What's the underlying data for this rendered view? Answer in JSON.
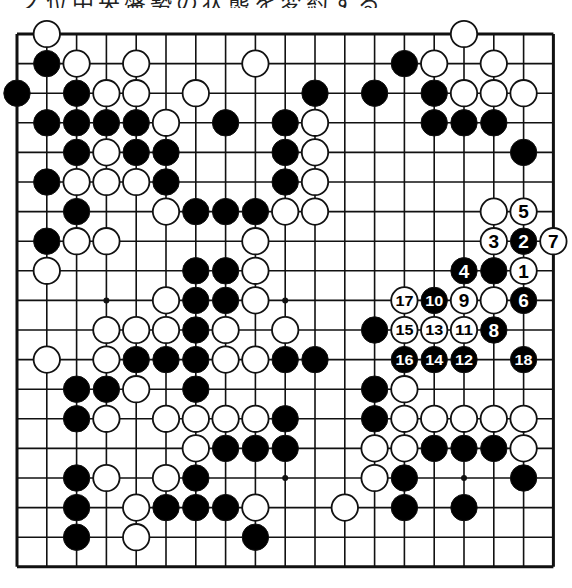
{
  "caption": "ノ位中央盤勢の状態を変約する",
  "board": {
    "size": 19,
    "origin": {
      "x": 17,
      "y": 34
    },
    "spacing": {
      "x": 29.8,
      "y": 29.6
    },
    "line_color": "#111111",
    "black_color": "#000000",
    "white_color": "#ffffff",
    "star_points": [
      [
        3,
        3
      ],
      [
        3,
        9
      ],
      [
        3,
        15
      ],
      [
        9,
        3
      ],
      [
        9,
        9
      ],
      [
        9,
        15
      ],
      [
        15,
        3
      ],
      [
        15,
        9
      ],
      [
        15,
        15
      ]
    ],
    "visible_star_points": [
      [
        9,
        9
      ],
      [
        15,
        9
      ],
      [
        15,
        15
      ]
    ]
  },
  "stones": [
    {
      "row": 0,
      "col": 1,
      "color": "white"
    },
    {
      "row": 0,
      "col": 15,
      "color": "white"
    },
    {
      "row": 1,
      "col": 1,
      "color": "black"
    },
    {
      "row": 1,
      "col": 2,
      "color": "white"
    },
    {
      "row": 1,
      "col": 4,
      "color": "white"
    },
    {
      "row": 1,
      "col": 8,
      "color": "white"
    },
    {
      "row": 1,
      "col": 13,
      "color": "black"
    },
    {
      "row": 1,
      "col": 14,
      "color": "white"
    },
    {
      "row": 1,
      "col": 16,
      "color": "white"
    },
    {
      "row": 2,
      "col": 0,
      "color": "black"
    },
    {
      "row": 2,
      "col": 2,
      "color": "black"
    },
    {
      "row": 2,
      "col": 3,
      "color": "white"
    },
    {
      "row": 2,
      "col": 4,
      "color": "white"
    },
    {
      "row": 2,
      "col": 6,
      "color": "white"
    },
    {
      "row": 2,
      "col": 10,
      "color": "black"
    },
    {
      "row": 2,
      "col": 12,
      "color": "black"
    },
    {
      "row": 2,
      "col": 14,
      "color": "black"
    },
    {
      "row": 2,
      "col": 15,
      "color": "white"
    },
    {
      "row": 2,
      "col": 16,
      "color": "white"
    },
    {
      "row": 2,
      "col": 17,
      "color": "white"
    },
    {
      "row": 3,
      "col": 1,
      "color": "black"
    },
    {
      "row": 3,
      "col": 2,
      "color": "black"
    },
    {
      "row": 3,
      "col": 3,
      "color": "black"
    },
    {
      "row": 3,
      "col": 4,
      "color": "black"
    },
    {
      "row": 3,
      "col": 5,
      "color": "white"
    },
    {
      "row": 3,
      "col": 7,
      "color": "black"
    },
    {
      "row": 3,
      "col": 9,
      "color": "black"
    },
    {
      "row": 3,
      "col": 10,
      "color": "white"
    },
    {
      "row": 3,
      "col": 14,
      "color": "black"
    },
    {
      "row": 3,
      "col": 15,
      "color": "black"
    },
    {
      "row": 3,
      "col": 16,
      "color": "black"
    },
    {
      "row": 4,
      "col": 2,
      "color": "black"
    },
    {
      "row": 4,
      "col": 3,
      "color": "white"
    },
    {
      "row": 4,
      "col": 4,
      "color": "black"
    },
    {
      "row": 4,
      "col": 5,
      "color": "black"
    },
    {
      "row": 4,
      "col": 9,
      "color": "black"
    },
    {
      "row": 4,
      "col": 10,
      "color": "white"
    },
    {
      "row": 4,
      "col": 17,
      "color": "black"
    },
    {
      "row": 5,
      "col": 1,
      "color": "black"
    },
    {
      "row": 5,
      "col": 2,
      "color": "white"
    },
    {
      "row": 5,
      "col": 3,
      "color": "white"
    },
    {
      "row": 5,
      "col": 4,
      "color": "white"
    },
    {
      "row": 5,
      "col": 5,
      "color": "black"
    },
    {
      "row": 5,
      "col": 9,
      "color": "black"
    },
    {
      "row": 5,
      "col": 10,
      "color": "white"
    },
    {
      "row": 6,
      "col": 2,
      "color": "black"
    },
    {
      "row": 6,
      "col": 5,
      "color": "white"
    },
    {
      "row": 6,
      "col": 6,
      "color": "black"
    },
    {
      "row": 6,
      "col": 7,
      "color": "black"
    },
    {
      "row": 6,
      "col": 8,
      "color": "black"
    },
    {
      "row": 6,
      "col": 9,
      "color": "white"
    },
    {
      "row": 6,
      "col": 10,
      "color": "white"
    },
    {
      "row": 6,
      "col": 16,
      "color": "white"
    },
    {
      "row": 6,
      "col": 17,
      "color": "white",
      "label": "5"
    },
    {
      "row": 7,
      "col": 1,
      "color": "black"
    },
    {
      "row": 7,
      "col": 2,
      "color": "white"
    },
    {
      "row": 7,
      "col": 3,
      "color": "white"
    },
    {
      "row": 7,
      "col": 8,
      "color": "white"
    },
    {
      "row": 7,
      "col": 16,
      "color": "white",
      "label": "3"
    },
    {
      "row": 7,
      "col": 17,
      "color": "black",
      "label": "2"
    },
    {
      "row": 7,
      "col": 18,
      "color": "white",
      "label": "7"
    },
    {
      "row": 8,
      "col": 1,
      "color": "white"
    },
    {
      "row": 8,
      "col": 6,
      "color": "black"
    },
    {
      "row": 8,
      "col": 7,
      "color": "black"
    },
    {
      "row": 8,
      "col": 8,
      "color": "white"
    },
    {
      "row": 8,
      "col": 15,
      "color": "black",
      "label": "4"
    },
    {
      "row": 8,
      "col": 16,
      "color": "black"
    },
    {
      "row": 8,
      "col": 17,
      "color": "white",
      "label": "1"
    },
    {
      "row": 9,
      "col": 5,
      "color": "white"
    },
    {
      "row": 9,
      "col": 6,
      "color": "black"
    },
    {
      "row": 9,
      "col": 7,
      "color": "black"
    },
    {
      "row": 9,
      "col": 8,
      "color": "white"
    },
    {
      "row": 9,
      "col": 13,
      "color": "white",
      "label": "17"
    },
    {
      "row": 9,
      "col": 14,
      "color": "black",
      "label": "10"
    },
    {
      "row": 9,
      "col": 15,
      "color": "white",
      "label": "9"
    },
    {
      "row": 9,
      "col": 16,
      "color": "white"
    },
    {
      "row": 9,
      "col": 17,
      "color": "black",
      "label": "6"
    },
    {
      "row": 10,
      "col": 3,
      "color": "white"
    },
    {
      "row": 10,
      "col": 4,
      "color": "white"
    },
    {
      "row": 10,
      "col": 5,
      "color": "white"
    },
    {
      "row": 10,
      "col": 6,
      "color": "black"
    },
    {
      "row": 10,
      "col": 7,
      "color": "white"
    },
    {
      "row": 10,
      "col": 9,
      "color": "white"
    },
    {
      "row": 10,
      "col": 12,
      "color": "black"
    },
    {
      "row": 10,
      "col": 13,
      "color": "white",
      "label": "15"
    },
    {
      "row": 10,
      "col": 14,
      "color": "white",
      "label": "13"
    },
    {
      "row": 10,
      "col": 15,
      "color": "white",
      "label": "11"
    },
    {
      "row": 10,
      "col": 16,
      "color": "black",
      "label": "8"
    },
    {
      "row": 11,
      "col": 1,
      "color": "white"
    },
    {
      "row": 11,
      "col": 3,
      "color": "white"
    },
    {
      "row": 11,
      "col": 4,
      "color": "black"
    },
    {
      "row": 11,
      "col": 5,
      "color": "black"
    },
    {
      "row": 11,
      "col": 6,
      "color": "black"
    },
    {
      "row": 11,
      "col": 7,
      "color": "white"
    },
    {
      "row": 11,
      "col": 8,
      "color": "white"
    },
    {
      "row": 11,
      "col": 9,
      "color": "black"
    },
    {
      "row": 11,
      "col": 10,
      "color": "black"
    },
    {
      "row": 11,
      "col": 13,
      "color": "black",
      "label": "16"
    },
    {
      "row": 11,
      "col": 14,
      "color": "black",
      "label": "14"
    },
    {
      "row": 11,
      "col": 15,
      "color": "black",
      "label": "12"
    },
    {
      "row": 11,
      "col": 17,
      "color": "black",
      "label": "18"
    },
    {
      "row": 12,
      "col": 2,
      "color": "black"
    },
    {
      "row": 12,
      "col": 3,
      "color": "black"
    },
    {
      "row": 12,
      "col": 4,
      "color": "white"
    },
    {
      "row": 12,
      "col": 6,
      "color": "black"
    },
    {
      "row": 12,
      "col": 12,
      "color": "black"
    },
    {
      "row": 12,
      "col": 13,
      "color": "white"
    },
    {
      "row": 13,
      "col": 2,
      "color": "black"
    },
    {
      "row": 13,
      "col": 3,
      "color": "white"
    },
    {
      "row": 13,
      "col": 5,
      "color": "white"
    },
    {
      "row": 13,
      "col": 6,
      "color": "white"
    },
    {
      "row": 13,
      "col": 7,
      "color": "white"
    },
    {
      "row": 13,
      "col": 8,
      "color": "white"
    },
    {
      "row": 13,
      "col": 9,
      "color": "black"
    },
    {
      "row": 13,
      "col": 12,
      "color": "black"
    },
    {
      "row": 13,
      "col": 13,
      "color": "white"
    },
    {
      "row": 13,
      "col": 14,
      "color": "white"
    },
    {
      "row": 13,
      "col": 15,
      "color": "white"
    },
    {
      "row": 13,
      "col": 16,
      "color": "white"
    },
    {
      "row": 13,
      "col": 17,
      "color": "white"
    },
    {
      "row": 14,
      "col": 6,
      "color": "white"
    },
    {
      "row": 14,
      "col": 7,
      "color": "black"
    },
    {
      "row": 14,
      "col": 8,
      "color": "black"
    },
    {
      "row": 14,
      "col": 9,
      "color": "black"
    },
    {
      "row": 14,
      "col": 12,
      "color": "white"
    },
    {
      "row": 14,
      "col": 13,
      "color": "white"
    },
    {
      "row": 14,
      "col": 14,
      "color": "black"
    },
    {
      "row": 14,
      "col": 15,
      "color": "black"
    },
    {
      "row": 14,
      "col": 16,
      "color": "black"
    },
    {
      "row": 14,
      "col": 17,
      "color": "white"
    },
    {
      "row": 15,
      "col": 2,
      "color": "black"
    },
    {
      "row": 15,
      "col": 3,
      "color": "white"
    },
    {
      "row": 15,
      "col": 5,
      "color": "white"
    },
    {
      "row": 15,
      "col": 6,
      "color": "black"
    },
    {
      "row": 15,
      "col": 12,
      "color": "white"
    },
    {
      "row": 15,
      "col": 13,
      "color": "black"
    },
    {
      "row": 15,
      "col": 17,
      "color": "black"
    },
    {
      "row": 16,
      "col": 2,
      "color": "black"
    },
    {
      "row": 16,
      "col": 4,
      "color": "white"
    },
    {
      "row": 16,
      "col": 5,
      "color": "black"
    },
    {
      "row": 16,
      "col": 6,
      "color": "black"
    },
    {
      "row": 16,
      "col": 7,
      "color": "black"
    },
    {
      "row": 16,
      "col": 8,
      "color": "white"
    },
    {
      "row": 16,
      "col": 11,
      "color": "white"
    },
    {
      "row": 16,
      "col": 13,
      "color": "black"
    },
    {
      "row": 16,
      "col": 15,
      "color": "black"
    },
    {
      "row": 17,
      "col": 2,
      "color": "black"
    },
    {
      "row": 17,
      "col": 4,
      "color": "white"
    },
    {
      "row": 17,
      "col": 8,
      "color": "black"
    }
  ],
  "move_sequence": [
    {
      "move": 1,
      "color": "white",
      "row": 8,
      "col": 17
    },
    {
      "move": 2,
      "color": "black",
      "row": 7,
      "col": 17
    },
    {
      "move": 3,
      "color": "white",
      "row": 7,
      "col": 16
    },
    {
      "move": 4,
      "color": "black",
      "row": 8,
      "col": 15
    },
    {
      "move": 5,
      "color": "white",
      "row": 6,
      "col": 17
    },
    {
      "move": 6,
      "color": "black",
      "row": 9,
      "col": 17
    },
    {
      "move": 7,
      "color": "white",
      "row": 7,
      "col": 18
    },
    {
      "move": 8,
      "color": "black",
      "row": 10,
      "col": 16
    },
    {
      "move": 9,
      "color": "white",
      "row": 9,
      "col": 15
    },
    {
      "move": 10,
      "color": "black",
      "row": 9,
      "col": 14
    },
    {
      "move": 11,
      "color": "white",
      "row": 10,
      "col": 15
    },
    {
      "move": 12,
      "color": "black",
      "row": 11,
      "col": 15
    },
    {
      "move": 13,
      "color": "white",
      "row": 10,
      "col": 14
    },
    {
      "move": 14,
      "color": "black",
      "row": 11,
      "col": 14
    },
    {
      "move": 15,
      "color": "white",
      "row": 10,
      "col": 13
    },
    {
      "move": 16,
      "color": "black",
      "row": 11,
      "col": 13
    },
    {
      "move": 17,
      "color": "white",
      "row": 9,
      "col": 13
    },
    {
      "move": 18,
      "color": "black",
      "row": 11,
      "col": 17
    }
  ]
}
